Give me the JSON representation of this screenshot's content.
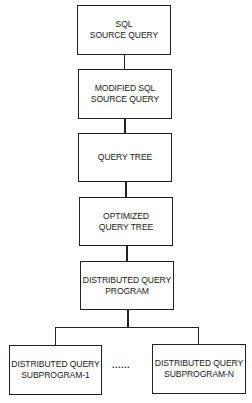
{
  "diagram": {
    "type": "flowchart",
    "direction": "top-to-bottom",
    "nodes": [
      {
        "id": "sql-source-query",
        "lines": [
          "SQL",
          "SOURCE QUERY"
        ]
      },
      {
        "id": "modified-sql-source-query",
        "lines": [
          "MODIFIED SQL",
          "SOURCE QUERY"
        ]
      },
      {
        "id": "query-tree",
        "lines": [
          "QUERY TREE"
        ]
      },
      {
        "id": "optimized-query-tree",
        "lines": [
          "OPTIMIZED",
          "QUERY TREE"
        ]
      },
      {
        "id": "distributed-query-program",
        "lines": [
          "DISTRIBUTED QUERY",
          "PROGRAM"
        ]
      },
      {
        "id": "distributed-query-subprogram-1",
        "lines": [
          "DISTRIBUTED QUERY",
          "SUBPROGRAM-1"
        ]
      },
      {
        "id": "distributed-query-subprogram-n",
        "lines": [
          "DISTRIBUTED QUERY",
          "SUBPROGRAM-N"
        ]
      }
    ],
    "edges": [
      {
        "from": "sql-source-query",
        "to": "modified-sql-source-query"
      },
      {
        "from": "modified-sql-source-query",
        "to": "query-tree"
      },
      {
        "from": "query-tree",
        "to": "optimized-query-tree"
      },
      {
        "from": "optimized-query-tree",
        "to": "distributed-query-program"
      },
      {
        "from": "distributed-query-program",
        "to": "distributed-query-subprogram-1"
      },
      {
        "from": "distributed-query-program",
        "to": "distributed-query-subprogram-n"
      }
    ],
    "ellipsis": "......"
  }
}
